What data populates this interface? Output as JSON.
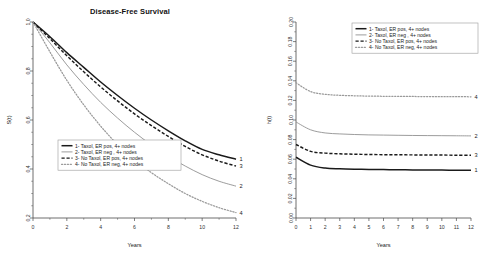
{
  "figure": {
    "title": "Disease-Free Survival",
    "legend_entries": [
      "1- Taxol, ER pos, 4+ nodes",
      "2- Taxol, ER neg , 4+ nodes",
      "3- No Taxol, ER pos, 4+ nodes",
      "4- No Taxol, ER neg, 4+ nodes"
    ],
    "curve_end_labels": [
      "1",
      "2",
      "3",
      "4"
    ]
  },
  "chart_data": [
    {
      "type": "line",
      "panel": "left",
      "title": "Disease-Free Survival",
      "xlabel": "Years",
      "ylabel": "S(t)",
      "xlim": [
        0,
        12
      ],
      "ylim": [
        0.2,
        1.0
      ],
      "xticks": [
        0,
        2,
        4,
        6,
        8,
        10,
        12
      ],
      "xticklabels": [
        "0",
        "2",
        "4",
        "6",
        "8",
        "10",
        "12"
      ],
      "yticks": [
        0.2,
        0.4,
        0.6,
        0.8,
        1.0
      ],
      "yticklabels": [
        "0.2",
        "0.4",
        "0.6",
        "0.8",
        "1.0"
      ],
      "grid": false,
      "legend_position": "lower-left",
      "x": [
        0,
        1,
        2,
        3,
        4,
        5,
        6,
        7,
        8,
        9,
        10,
        11,
        12
      ],
      "series": [
        {
          "name": "1- Taxol, ER pos, 4+ nodes",
          "label": "1",
          "style": "solid-thick",
          "color": "#1a1a1a",
          "values": [
            1.0,
            0.94,
            0.875,
            0.815,
            0.755,
            0.7,
            0.648,
            0.6,
            0.556,
            0.515,
            0.48,
            0.458,
            0.44
          ]
        },
        {
          "name": "2- Taxol, ER neg , 4+ nodes",
          "label": "2",
          "style": "solid-thin",
          "color": "#8a8a8a",
          "values": [
            1.0,
            0.915,
            0.825,
            0.745,
            0.672,
            0.608,
            0.55,
            0.498,
            0.452,
            0.412,
            0.377,
            0.35,
            0.33
          ]
        },
        {
          "name": "3- No Taxol, ER pos, 4+ nodes",
          "label": "3",
          "style": "dashed",
          "color": "#1a1a1a",
          "values": [
            1.0,
            0.932,
            0.862,
            0.797,
            0.735,
            0.678,
            0.625,
            0.577,
            0.533,
            0.492,
            0.458,
            0.432,
            0.412
          ]
        },
        {
          "name": "4- No Taxol, ER neg, 4+ nodes",
          "label": "4",
          "style": "dotted",
          "color": "#9a9a9a",
          "values": [
            1.0,
            0.878,
            0.762,
            0.662,
            0.575,
            0.5,
            0.438,
            0.385,
            0.34,
            0.3,
            0.268,
            0.242,
            0.222
          ]
        }
      ]
    },
    {
      "type": "line",
      "panel": "right",
      "title": "",
      "xlabel": "Years",
      "ylabel": "h(t)",
      "xlim": [
        0,
        12
      ],
      "ylim": [
        0.0,
        0.2
      ],
      "xticks": [
        0,
        1,
        2,
        3,
        4,
        5,
        6,
        7,
        8,
        9,
        10,
        11,
        12
      ],
      "xticklabels": [
        "0",
        "1",
        "2",
        "3",
        "4",
        "5",
        "6",
        "7",
        "8",
        "9",
        "10",
        "11",
        "12"
      ],
      "yticks": [
        0.0,
        0.02,
        0.04,
        0.06,
        0.08,
        0.1,
        0.12,
        0.14,
        0.16,
        0.18,
        0.2
      ],
      "yticklabels": [
        "0.00",
        "0.02",
        "0.04",
        "0.06",
        "0.08",
        "0.10",
        "0.12",
        "0.14",
        "0.16",
        "0.18",
        "0.20"
      ],
      "grid": false,
      "legend_position": "upper-right",
      "x": [
        0,
        1,
        2,
        3,
        4,
        5,
        6,
        7,
        8,
        9,
        10,
        11,
        12
      ],
      "series": [
        {
          "name": "1- Taxol, ER pos, 4+ nodes",
          "label": "1",
          "style": "solid-thick",
          "color": "#1a1a1a",
          "values": [
            0.062,
            0.054,
            0.051,
            0.0502,
            0.0498,
            0.0496,
            0.0494,
            0.0492,
            0.0491,
            0.049,
            0.0489,
            0.0488,
            0.0488
          ]
        },
        {
          "name": "2- Taxol, ER neg , 4+ nodes",
          "label": "2",
          "style": "solid-thin",
          "color": "#8a8a8a",
          "values": [
            0.098,
            0.09,
            0.0868,
            0.0858,
            0.0852,
            0.0848,
            0.0846,
            0.0844,
            0.0842,
            0.0841,
            0.084,
            0.0839,
            0.0838
          ]
        },
        {
          "name": "3- No Taxol, ER pos, 4+ nodes",
          "label": "3",
          "style": "dashed",
          "color": "#1a1a1a",
          "values": [
            0.075,
            0.068,
            0.0662,
            0.0655,
            0.0651,
            0.0648,
            0.0646,
            0.0645,
            0.0644,
            0.0643,
            0.0642,
            0.0641,
            0.064
          ]
        },
        {
          "name": "4- No Taxol, ER neg, 4+ nodes",
          "label": "4",
          "style": "dotted",
          "color": "#9a9a9a",
          "values": [
            0.138,
            0.129,
            0.1262,
            0.1252,
            0.1247,
            0.1244,
            0.1242,
            0.1241,
            0.124,
            0.1239,
            0.1238,
            0.1238,
            0.1237
          ]
        }
      ]
    }
  ]
}
